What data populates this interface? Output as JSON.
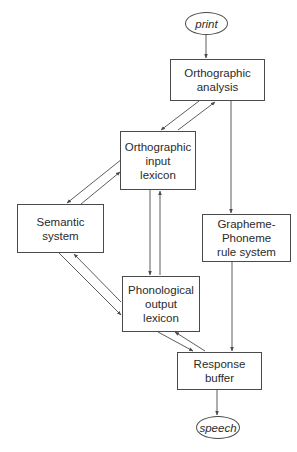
{
  "nodes": {
    "print": {
      "label": "print",
      "shape": "ellipse"
    },
    "orthographic_analysis": {
      "label": "Orthographic\nanalysis",
      "shape": "box"
    },
    "orthographic_input_lexicon": {
      "label": "Orthographic\ninput\nlexicon",
      "shape": "box"
    },
    "semantic_system": {
      "label": "Semantic\nsystem",
      "shape": "box"
    },
    "grapheme_phoneme_rule_system": {
      "label": "Grapheme-\nPhoneme\nrule system",
      "shape": "box"
    },
    "phonological_output_lexicon": {
      "label": "Phonological\noutput\nlexicon",
      "shape": "box"
    },
    "response_buffer": {
      "label": "Response\nbuffer",
      "shape": "box"
    },
    "speech": {
      "label": "speech",
      "shape": "ellipse"
    }
  },
  "edges": [
    {
      "from": "print",
      "to": "orthographic_analysis"
    },
    {
      "from": "orthographic_analysis",
      "to": "orthographic_input_lexicon"
    },
    {
      "from": "orthographic_input_lexicon",
      "to": "orthographic_analysis"
    },
    {
      "from": "orthographic_analysis",
      "to": "grapheme_phoneme_rule_system"
    },
    {
      "from": "orthographic_input_lexicon",
      "to": "semantic_system"
    },
    {
      "from": "semantic_system",
      "to": "orthographic_input_lexicon"
    },
    {
      "from": "orthographic_input_lexicon",
      "to": "phonological_output_lexicon"
    },
    {
      "from": "phonological_output_lexicon",
      "to": "orthographic_input_lexicon"
    },
    {
      "from": "semantic_system",
      "to": "phonological_output_lexicon"
    },
    {
      "from": "phonological_output_lexicon",
      "to": "semantic_system"
    },
    {
      "from": "phonological_output_lexicon",
      "to": "response_buffer"
    },
    {
      "from": "response_buffer",
      "to": "phonological_output_lexicon"
    },
    {
      "from": "grapheme_phoneme_rule_system",
      "to": "response_buffer"
    },
    {
      "from": "response_buffer",
      "to": "speech"
    }
  ],
  "colors": {
    "line": "#4a4a4a",
    "text": "#2b2b2b",
    "background": "#ffffff"
  }
}
